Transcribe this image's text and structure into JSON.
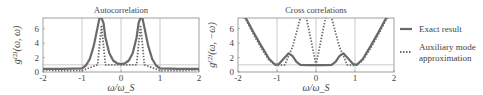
{
  "chart_data": [
    {
      "type": "line",
      "title": "Autocorrelation",
      "xlabel": "ω/ω_S",
      "ylabel": "g^(2)(ω,ω)",
      "xlim": [
        -2,
        2
      ],
      "ylim": [
        0,
        7.5
      ],
      "xticks": [
        "-2",
        "-1",
        "0",
        "1",
        "2"
      ],
      "yticks": [
        "0",
        "2",
        "4",
        "6"
      ],
      "grid": "vertical lines at x=-1, 0, 1 and horizontal at y=1",
      "series": [
        {
          "name": "Exact result",
          "style": "solid",
          "x": [
            -2,
            -1.5,
            -1.0,
            -0.9,
            -0.8,
            -0.7,
            -0.6,
            -0.55,
            -0.5,
            -0.45,
            -0.4,
            -0.3,
            -0.2,
            -0.1,
            0,
            0.1,
            0.2,
            0.3,
            0.4,
            0.45,
            0.5,
            0.55,
            0.6,
            0.7,
            0.8,
            0.9,
            1.0,
            1.5,
            2
          ],
          "y": [
            0.45,
            0.45,
            0.5,
            0.9,
            1.8,
            3.6,
            6.2,
            7.5,
            7.5,
            6.8,
            4.8,
            2.6,
            1.6,
            1.2,
            1.1,
            1.2,
            1.6,
            2.6,
            4.8,
            6.8,
            7.5,
            7.5,
            6.2,
            3.6,
            1.8,
            0.9,
            0.5,
            0.45,
            0.45
          ]
        },
        {
          "name": "Auxiliary mode approximation",
          "style": "dotted",
          "x": [
            -2,
            -1.6,
            -1.0,
            -0.6,
            -0.5,
            -0.4,
            0,
            0.4,
            0.5,
            0.6,
            1.0,
            1.6,
            2
          ],
          "y": [
            0.3,
            0.2,
            0.2,
            1.0,
            6.5,
            1.0,
            1.0,
            1.0,
            6.5,
            1.0,
            0.2,
            0.2,
            0.3
          ]
        }
      ]
    },
    {
      "type": "line",
      "title": "Cross correlations",
      "xlabel": "ω/ω_S",
      "ylabel": "g^(2)(ω,−ω)",
      "xlim": [
        -2,
        2
      ],
      "ylim": [
        0,
        7.5
      ],
      "xticks": [
        "-2",
        "-1",
        "0",
        "1",
        "2"
      ],
      "yticks": [
        "0",
        "2",
        "4",
        "6"
      ],
      "grid": "vertical lines at x=-1, 0, 1 and horizontal at y=1",
      "series": [
        {
          "name": "Exact result",
          "style": "solid",
          "x": [
            -2,
            -1.8,
            -1.6,
            -1.4,
            -1.2,
            -1.05,
            -0.95,
            -0.8,
            -0.7,
            -0.6,
            -0.5,
            -0.4,
            -0.2,
            0,
            0.2,
            0.4,
            0.5,
            0.6,
            0.7,
            0.8,
            0.95,
            1.05,
            1.2,
            1.4,
            1.6,
            1.8,
            2
          ],
          "y": [
            8.5,
            7.5,
            5.5,
            3.6,
            1.8,
            1.0,
            1.1,
            2.0,
            2.6,
            2.2,
            1.4,
            1.0,
            0.95,
            0.95,
            0.95,
            1.0,
            1.4,
            2.2,
            2.6,
            2.0,
            1.1,
            1.0,
            1.8,
            3.6,
            5.5,
            7.5,
            8.5
          ]
        },
        {
          "name": "Auxiliary mode approximation",
          "style": "dotted",
          "x": [
            -2,
            -1.8,
            -1.6,
            -1.4,
            -1.2,
            -1.0,
            -0.8,
            -0.6,
            -0.5,
            -0.4,
            -0.3,
            0,
            0.3,
            0.4,
            0.5,
            0.6,
            0.8,
            1.0,
            1.2,
            1.4,
            1.6,
            1.8,
            2
          ],
          "y": [
            8.5,
            7.3,
            5.2,
            3.3,
            1.6,
            0.9,
            1.0,
            3.5,
            5.5,
            7.5,
            9,
            1.0,
            9,
            7.5,
            5.5,
            3.5,
            1.0,
            0.9,
            1.6,
            3.3,
            5.2,
            7.3,
            8.5
          ]
        }
      ]
    }
  ],
  "panels": {
    "left": {
      "title": "Autocorrelation",
      "ylabel": "g⁽²⁾(ω, ω)",
      "xlabel": "ω/ω_S",
      "yticks": [
        "0",
        "2",
        "4",
        "6"
      ],
      "xticks": [
        "-2",
        "-1",
        "0",
        "1",
        "2"
      ]
    },
    "right": {
      "title": "Cross correlations",
      "ylabel": "g⁽²⁾(ω, −ω)",
      "xlabel": "ω/ω_S",
      "yticks": [
        "0",
        "2",
        "4",
        "6"
      ],
      "xticks": [
        "-2",
        "-1",
        "0",
        "1",
        "2"
      ]
    }
  },
  "legend": {
    "exact": "Exact result",
    "aux_line1": "Auxiliary mode",
    "aux_line2": "approximation"
  },
  "colors": {
    "exact": "#6a6a6a",
    "aux": "#6a6a6a",
    "frame": "#888888",
    "grid": "#aaaaaa"
  }
}
